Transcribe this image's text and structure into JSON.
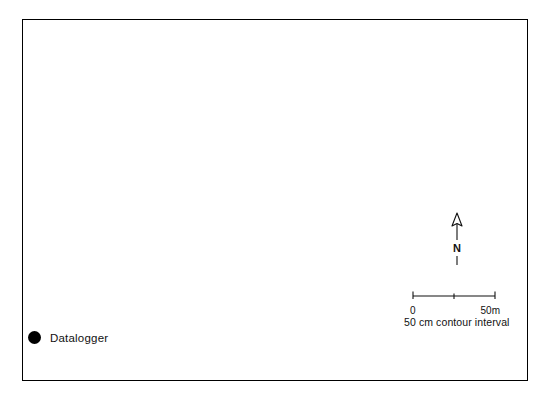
{
  "map": {
    "title_feature": "Little Rush Creek",
    "creek_words": [
      {
        "text": "Little",
        "x": 88,
        "y": 40,
        "rot": -6
      },
      {
        "text": "Rush",
        "x": 145,
        "y": 42,
        "rot": -5
      },
      {
        "text": "Creek",
        "x": 208,
        "y": 46,
        "rot": -4
      }
    ],
    "contour_labels": [
      {
        "text": "269",
        "x": 26,
        "y": 196,
        "rot": -14
      },
      {
        "text": "270",
        "x": 38,
        "y": 246,
        "rot": -17
      },
      {
        "text": "271",
        "x": 62,
        "y": 294,
        "rot": -6
      },
      {
        "text": "271",
        "x": 177,
        "y": 147,
        "rot": -72
      },
      {
        "text": "271",
        "x": 265,
        "y": 78,
        "rot": -74
      },
      {
        "text": "271",
        "x": 420,
        "y": 127,
        "rot": -12
      },
      {
        "text": "284",
        "x": 236,
        "y": 180,
        "rot": -16
      },
      {
        "text": "284",
        "x": 338,
        "y": 156,
        "rot": -62
      },
      {
        "text": "284",
        "x": 345,
        "y": 186,
        "rot": -12
      },
      {
        "text": "286 m.o.d",
        "x": 348,
        "y": 221,
        "rot": -16
      }
    ],
    "dataloggers": [
      {
        "name": "datalogger-north-ridge",
        "x": 152,
        "y": 129
      },
      {
        "name": "datalogger-mid-slope",
        "x": 292,
        "y": 151
      },
      {
        "name": "datalogger-northeast",
        "x": 390,
        "y": 65
      },
      {
        "name": "datalogger-west-margin",
        "x": 60,
        "y": 198
      },
      {
        "name": "datalogger-southeast",
        "x": 363,
        "y": 325
      }
    ],
    "colors": {
      "frame": "#000000",
      "contour": "#2e2e2e",
      "creek": "#000000",
      "marker": "#000000",
      "background": "#ffffff"
    }
  },
  "legend": {
    "datalogger_label": "Datalogger",
    "marker_icon": "filled-circle-icon"
  },
  "north_arrow": {
    "letter": "N",
    "icon": "north-arrow-icon"
  },
  "scale_bar": {
    "min_label": "0",
    "max_label": "50m",
    "tick_count": 3
  },
  "notes": {
    "contour_interval": "50 cm contour interval"
  }
}
